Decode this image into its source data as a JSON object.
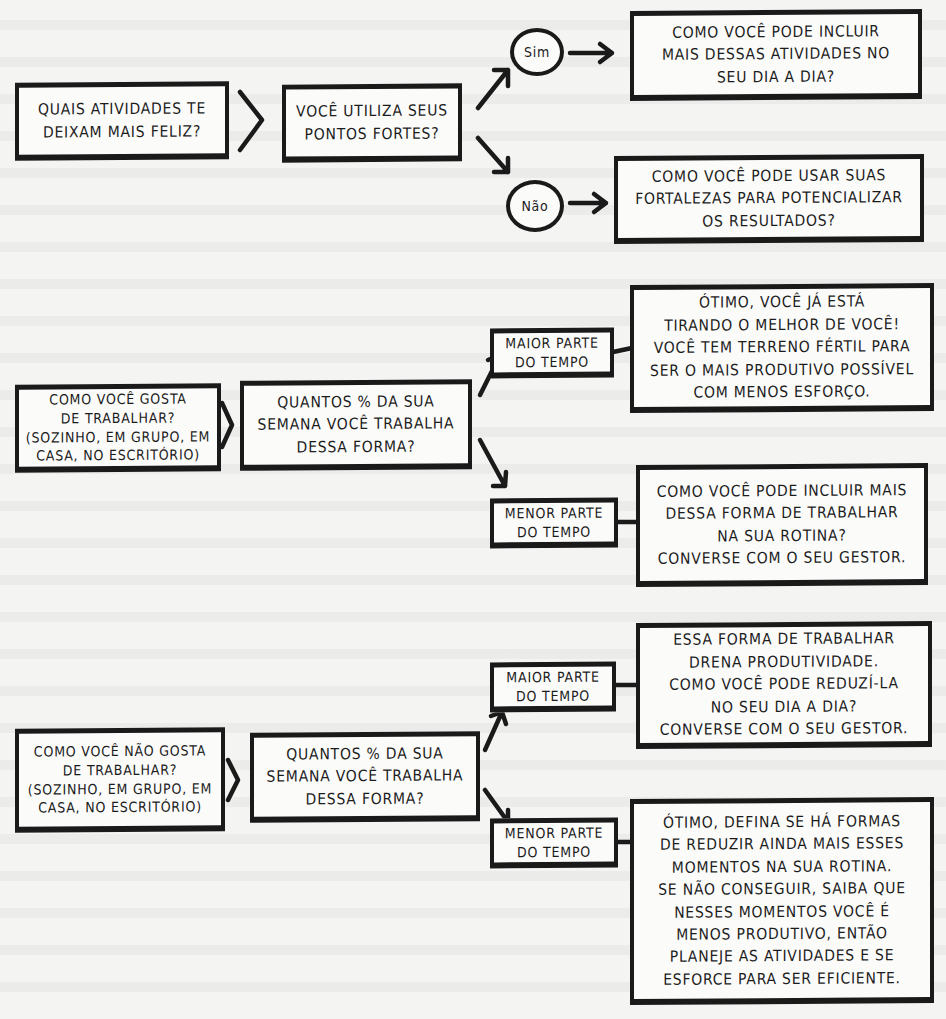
{
  "flowchart_1": {
    "start": "Quais atividades te\ndeixam mais feliz?",
    "question": "Você utiliza seus\npontos fortes?",
    "yes_label": "Sim",
    "no_label": "Não",
    "yes_outcome": "Como você pode incluir\nmais dessas atividades no\nseu dia a dia?",
    "no_outcome": "Como você pode usar suas\nfortalezas para potencializar\nos resultados?"
  },
  "flowchart_2": {
    "start": "Como você gosta\nde trabalhar?\n(sozinho, em grupo, em\ncasa, no escritório)",
    "question": "Quantos % da sua\nsemana você trabalha\ndessa forma?",
    "most_label": "Maior parte\ndo tempo",
    "least_label": "Menor parte\ndo tempo",
    "most_outcome": "Ótimo, você já está\ntirando o melhor de você!\nVocê tem terreno fértil para\nser o mais produtivo possível\ncom menos esforço.",
    "least_outcome": "Como você pode incluir mais\ndessa forma de trabalhar\nna sua rotina?\nConverse com o seu gestor."
  },
  "flowchart_3": {
    "start": "Como você não gosta\nde trabalhar?\n(sozinho, em grupo, em\ncasa, no escritório)",
    "question": "Quantos % da sua\nsemana você trabalha\ndessa forma?",
    "most_label": "Maior parte\ndo tempo",
    "least_label": "Menor parte\ndo tempo",
    "most_outcome": "Essa forma de trabalhar\ndrena produtividade.\nComo você pode reduzí-la\nno seu dia a dia?\nConverse com o seu gestor.",
    "least_outcome": "Ótimo, defina se há formas\nde reduzir ainda mais esses\nmomentos na sua rotina.\nSe não conseguir, saiba que\nnesses momentos você é\nmenos produtivo, então\nplaneje as atividades e se\nesforce para ser eficiente."
  },
  "colors": {
    "ink": "#1a1a1a",
    "paper": "#f4f4f2"
  }
}
